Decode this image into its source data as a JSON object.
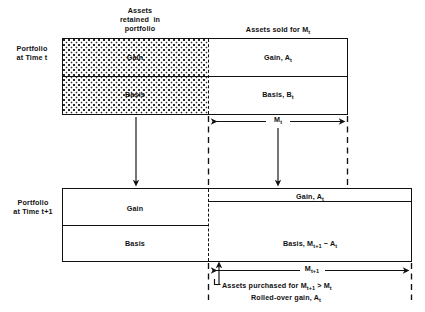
{
  "figure": {
    "title_top_left": "Assets\nretained in\nportfolio",
    "title_top_right": "Assets sold for M",
    "title_top_right_sub": "t"
  },
  "row_labels": {
    "upper": "Portfolio\nat Time t",
    "upper_line1": "Portfolio",
    "upper_line2": "at Time t",
    "lower_line1": "Portfolio",
    "lower_line2": "at Time t+1"
  },
  "upper_box": {
    "retained": {
      "gain": "Gain",
      "basis": "Basis"
    },
    "sold": {
      "gain_label": "Gain, A",
      "gain_sub": "t",
      "basis_label": "Basis, B",
      "basis_sub": "t"
    }
  },
  "lower_box": {
    "retained": {
      "gain": "Gain",
      "basis": "Basis"
    },
    "purchased": {
      "gain_label": "Gain, A",
      "gain_sub": "t",
      "basis_label": "Basis, M",
      "basis_sub1": "t+1",
      "basis_tail": " − A",
      "basis_sub2": "t"
    }
  },
  "dimensions": {
    "m_t_label": "M",
    "m_t_sub": "t",
    "m_t1_label": "M",
    "m_t1_sub": "t+1"
  },
  "annotations": {
    "purchased_note": "Assets purchased for M",
    "purchased_sub1": "t+1",
    "purchased_mid": " > M",
    "purchased_sub2": "t",
    "rolled_note": "Rolled-over gain, A",
    "rolled_sub": "t"
  },
  "colors": {
    "ink": "#111111",
    "paper": "#ffffff",
    "hatch": "#2a2a2a"
  }
}
